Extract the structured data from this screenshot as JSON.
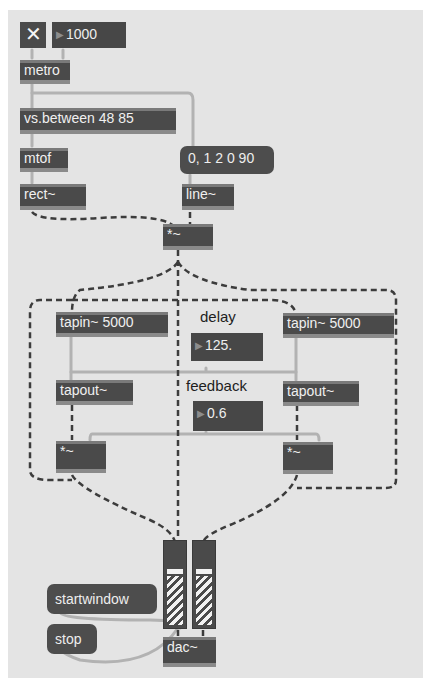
{
  "patch": {
    "toggle": {
      "symbol": "✕",
      "state": "on"
    },
    "metro_interval": {
      "value": "1000"
    },
    "objects": {
      "metro": "metro",
      "between": "vs.between 48 85",
      "mtof": "mtof",
      "rect": "rect~",
      "line": "line~",
      "mult_top": "*~",
      "tapin_left": "tapin~ 5000",
      "tapin_right": "tapin~ 5000",
      "tapout_left": "tapout~",
      "tapout_right": "tapout~",
      "mult_left": "*~",
      "mult_right": "*~",
      "dac": "dac~"
    },
    "messages": {
      "envelope": "0, 1 2 0 90",
      "startwindow": "startwindow",
      "stop": "stop"
    },
    "labels": {
      "delay": "delay",
      "feedback": "feedback"
    },
    "numbers": {
      "delay": "125.",
      "feedback": "0.6"
    },
    "meters": {
      "left": {
        "level_percent": 62
      },
      "right": {
        "level_percent": 62
      }
    },
    "colors": {
      "canvas": "#e4e4e4",
      "box": "#4a4a4a",
      "text": "#f0f0f0",
      "signal_wire": "#3a3a3a",
      "control_wire": "#b0b0b0"
    }
  }
}
